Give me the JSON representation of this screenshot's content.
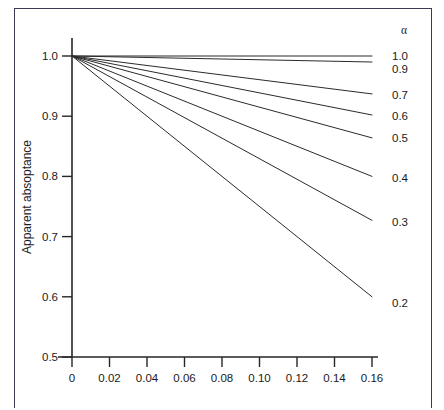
{
  "figure": {
    "background_color": "#ffffff",
    "frame_color": "#3a3a55",
    "line_color": "#2b2b2b",
    "axis_color": "#262626"
  },
  "axes": {
    "y_title": "Apparent absoptance",
    "x_title": "",
    "y_ticks": [
      "1.0",
      "0.9",
      "0.8",
      "0.7",
      "0.6",
      "0.5"
    ],
    "x_ticks": [
      "0",
      "0.02",
      "0.04",
      "0.06",
      "0.08",
      "0.10",
      "0.12",
      "0.14",
      "0.16"
    ]
  },
  "legend": {
    "title": "α",
    "position": "right-of-plot",
    "labels": [
      "1.0",
      "0.9",
      "0.7",
      "0.6",
      "0.5",
      "0.4",
      "0.3",
      "0.2"
    ]
  },
  "caption": {
    "text": ""
  },
  "chart_data": {
    "type": "line",
    "title": "",
    "subtitle": "",
    "xlabel": "",
    "ylabel": "Apparent absoptance",
    "xlim": [
      0,
      0.16
    ],
    "ylim": [
      0.5,
      1.0
    ],
    "xticks": [
      0,
      0.02,
      0.04,
      0.06,
      0.08,
      0.1,
      0.12,
      0.14,
      0.16
    ],
    "yticks": [
      0.5,
      0.6,
      0.7,
      0.8,
      0.9,
      1.0
    ],
    "xtick_labels": [
      "0",
      "0.02",
      "0.04",
      "0.06",
      "0.08",
      "0.10",
      "0.12",
      "0.14",
      "0.16"
    ],
    "ytick_labels": [
      "0.5",
      "0.6",
      "0.7",
      "0.8",
      "0.9",
      "1.0"
    ],
    "grid": false,
    "legend_title": "α",
    "legend_position": "right",
    "annotations": [
      "α"
    ],
    "x": [
      0,
      0.16
    ],
    "series": [
      {
        "name": "1.0",
        "label": "1.0",
        "alpha": 1.0,
        "values": [
          1.0,
          1.0
        ],
        "label_y": 1.0
      },
      {
        "name": "0.9",
        "label": "0.9",
        "alpha": 0.9,
        "values": [
          1.0,
          0.99
        ],
        "label_y": 0.978
      },
      {
        "name": "0.7",
        "label": "0.7",
        "alpha": 0.7,
        "values": [
          1.0,
          0.937
        ],
        "label_y": 0.935
      },
      {
        "name": "0.6",
        "label": "0.6",
        "alpha": 0.6,
        "values": [
          1.0,
          0.902
        ],
        "label_y": 0.9
      },
      {
        "name": "0.5",
        "label": "0.5",
        "alpha": 0.5,
        "values": [
          1.0,
          0.864
        ],
        "label_y": 0.863
      },
      {
        "name": "0.4",
        "label": "0.4",
        "alpha": 0.4,
        "values": [
          1.0,
          0.8
        ],
        "label_y": 0.798
      },
      {
        "name": "0.3",
        "label": "0.3",
        "alpha": 0.3,
        "values": [
          1.0,
          0.727
        ],
        "label_y": 0.725
      },
      {
        "name": "0.2",
        "label": "0.2",
        "alpha": 0.2,
        "values": [
          1.0,
          0.6
        ],
        "label_y": 0.59
      }
    ]
  }
}
